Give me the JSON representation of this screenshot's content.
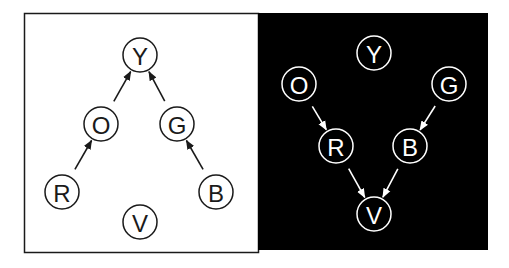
{
  "panels": [
    {
      "id": "left",
      "background": "#ffffff",
      "foreground": "#1a1a1a",
      "nodes": [
        {
          "id": "Y",
          "label": "Y"
        },
        {
          "id": "O",
          "label": "O"
        },
        {
          "id": "G",
          "label": "G"
        },
        {
          "id": "R",
          "label": "R"
        },
        {
          "id": "B",
          "label": "B"
        },
        {
          "id": "V",
          "label": "V"
        }
      ],
      "edges": [
        {
          "from": "O",
          "to": "Y"
        },
        {
          "from": "G",
          "to": "Y"
        },
        {
          "from": "R",
          "to": "O"
        },
        {
          "from": "B",
          "to": "G"
        }
      ]
    },
    {
      "id": "right",
      "background": "#000000",
      "foreground": "#ffffff",
      "nodes": [
        {
          "id": "Y",
          "label": "Y"
        },
        {
          "id": "O",
          "label": "O"
        },
        {
          "id": "G",
          "label": "G"
        },
        {
          "id": "R",
          "label": "R"
        },
        {
          "id": "B",
          "label": "B"
        },
        {
          "id": "V",
          "label": "V"
        }
      ],
      "edges": [
        {
          "from": "O",
          "to": "R"
        },
        {
          "from": "G",
          "to": "B"
        },
        {
          "from": "R",
          "to": "V"
        },
        {
          "from": "B",
          "to": "V"
        }
      ]
    }
  ]
}
